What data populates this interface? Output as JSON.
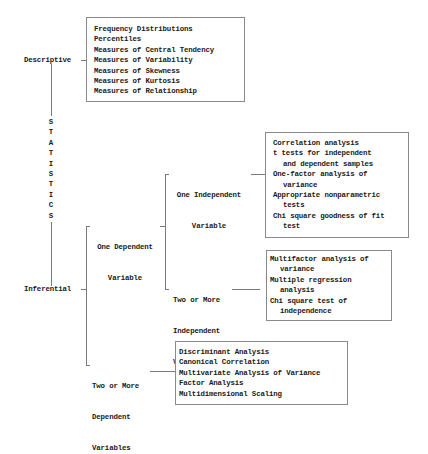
{
  "root": {
    "label_letters": [
      "S",
      "T",
      "A",
      "T",
      "I",
      "S",
      "T",
      "I",
      "C",
      "S"
    ]
  },
  "descriptive": {
    "label": "Descriptive",
    "items": [
      "Frequency Distributions",
      "Percentiles",
      "Measures of Central Tendency",
      "Measures of Variability",
      "Measures of Skewness",
      "Measures of Kurtosis",
      "Measures of Relationship"
    ]
  },
  "inferential": {
    "label": "Inferential",
    "one_dependent": {
      "label_line1": "One Dependent",
      "label_line2": "Variable",
      "one_independent": {
        "label_line1": "One Independent",
        "label_line2": "Variable",
        "items": [
          {
            "line1": "Correlation analysis"
          },
          {
            "line1": "t tests for independent",
            "line2": "and dependent samples"
          },
          {
            "line1": "One-factor analysis of",
            "line2": "variance"
          },
          {
            "line1": "Appropriate nonparametric",
            "line2": "tests"
          },
          {
            "line1": "Chi square goodness of fit",
            "line2": "test"
          }
        ]
      },
      "two_or_more_independent": {
        "label_line1": "Two or More",
        "label_line2": "Independent",
        "label_line3": "Variables",
        "items": [
          {
            "line1": "Multifactor analysis of",
            "line2": "variance"
          },
          {
            "line1": "Multiple regression",
            "line2": "analysis"
          },
          {
            "line1": "Chi square test of",
            "line2": "independence"
          }
        ]
      }
    },
    "two_or_more_dependent": {
      "label_line1": "Two or More",
      "label_line2": "Dependent",
      "label_line3": "Variables",
      "items": [
        "Discriminant Analysis",
        "Canonical Correlation",
        "Multivariate Analysis of Variance",
        "Factor Analysis",
        "Multidimensional Scaling"
      ]
    }
  }
}
